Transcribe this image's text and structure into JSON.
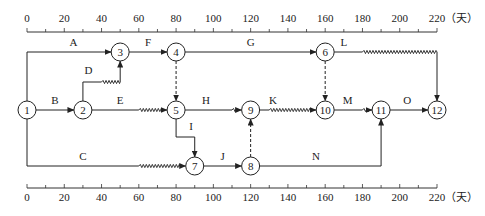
{
  "diagram": {
    "type": "time-scaled network diagram",
    "unit": "（天）",
    "axis": {
      "min": 0,
      "max": 220,
      "major_step": 20,
      "minor_step": 10,
      "ticks": [
        0,
        20,
        40,
        60,
        80,
        100,
        120,
        140,
        160,
        180,
        200,
        220
      ]
    },
    "nodes": [
      {
        "id": "1",
        "t": 0,
        "row": 2
      },
      {
        "id": "2",
        "t": 30,
        "row": 2
      },
      {
        "id": "3",
        "t": 50,
        "row": 1
      },
      {
        "id": "4",
        "t": 80,
        "row": 1
      },
      {
        "id": "5",
        "t": 80,
        "row": 2
      },
      {
        "id": "6",
        "t": 160,
        "row": 1
      },
      {
        "id": "7",
        "t": 90,
        "row": 3
      },
      {
        "id": "8",
        "t": 120,
        "row": 3
      },
      {
        "id": "9",
        "t": 120,
        "row": 2
      },
      {
        "id": "10",
        "t": 160,
        "row": 2
      },
      {
        "id": "11",
        "t": 190,
        "row": 2
      },
      {
        "id": "12",
        "t": 220,
        "row": 2
      }
    ],
    "activities": [
      {
        "label": "A",
        "from": "1",
        "to": "3",
        "duration_end": 50,
        "free_float": 0
      },
      {
        "label": "B",
        "from": "1",
        "to": "2",
        "duration_end": 30,
        "free_float": 0
      },
      {
        "label": "C",
        "from": "1",
        "to": "7",
        "duration_end": 60,
        "free_float": 30
      },
      {
        "label": "D",
        "from": "2",
        "to": "3",
        "duration_end": 40,
        "free_float": 10
      },
      {
        "label": "E",
        "from": "2",
        "to": "5",
        "duration_end": 60,
        "free_float": 20
      },
      {
        "label": "F",
        "from": "3",
        "to": "4",
        "duration_end": 80,
        "free_float": 0
      },
      {
        "label": "G",
        "from": "4",
        "to": "6",
        "duration_end": 160,
        "free_float": 0
      },
      {
        "label": "H",
        "from": "5",
        "to": "9",
        "duration_end": 110,
        "free_float": 10
      },
      {
        "label": "I",
        "from": "5",
        "to": "7",
        "duration_end": 90,
        "free_float": 0
      },
      {
        "label": "J",
        "from": "7",
        "to": "8",
        "duration_end": 120,
        "free_float": 0
      },
      {
        "label": "K",
        "from": "9",
        "to": "10",
        "duration_end": 130,
        "free_float": 30
      },
      {
        "label": "L",
        "from": "6",
        "to": "12",
        "duration_end": 180,
        "free_float": 40
      },
      {
        "label": "M",
        "from": "10",
        "to": "11",
        "duration_end": 180,
        "free_float": 10
      },
      {
        "label": "N",
        "from": "8",
        "to": "11",
        "duration_end": 190,
        "free_float": 0
      },
      {
        "label": "O",
        "from": "11",
        "to": "12",
        "duration_end": 220,
        "free_float": 0
      }
    ],
    "dummies": [
      {
        "from": "4",
        "to": "5"
      },
      {
        "from": "6",
        "to": "10"
      },
      {
        "from": "8",
        "to": "9"
      }
    ]
  }
}
